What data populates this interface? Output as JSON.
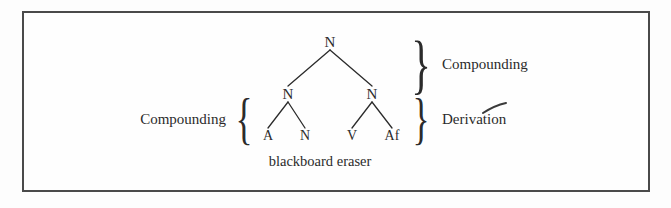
{
  "figure": {
    "background_color": "#fdfdfd",
    "frame_color": "#4a4a4a",
    "ink_color": "#2b2b2b"
  },
  "tree": {
    "root": {
      "label": "N",
      "x": 330,
      "y": 42
    },
    "internal_nodes": [
      {
        "label": "N",
        "x": 288,
        "y": 94
      },
      {
        "label": "N",
        "x": 372,
        "y": 94
      }
    ],
    "terminals": [
      {
        "label": "A",
        "x": 268,
        "y": 136
      },
      {
        "label": "N",
        "x": 305,
        "y": 136
      },
      {
        "label": "V",
        "x": 352,
        "y": 136
      },
      {
        "label": "Af",
        "x": 392,
        "y": 136
      }
    ],
    "edges": [
      {
        "x1": 330,
        "y1": 50,
        "x2": 288,
        "y2": 86
      },
      {
        "x1": 330,
        "y1": 50,
        "x2": 372,
        "y2": 86
      },
      {
        "x1": 288,
        "y1": 102,
        "x2": 268,
        "y2": 128
      },
      {
        "x1": 288,
        "y1": 102,
        "x2": 305,
        "y2": 128
      },
      {
        "x1": 372,
        "y1": 102,
        "x2": 352,
        "y2": 128
      },
      {
        "x1": 372,
        "y1": 102,
        "x2": 392,
        "y2": 128
      }
    ]
  },
  "word": {
    "text": "blackboard eraser",
    "x": 320,
    "y": 161
  },
  "annotations": [
    {
      "id": "compounding-right",
      "label": "Compounding",
      "brace": "}",
      "brace_x": 421,
      "brace_y": 64,
      "brace_height": 62,
      "label_x": 442,
      "label_y": 64
    },
    {
      "id": "compounding-left",
      "label": "Compounding",
      "brace": "{",
      "brace_x": 244,
      "brace_y": 119,
      "brace_height": 54,
      "label_x": 226,
      "label_y": 119
    },
    {
      "id": "derivation-right",
      "label": "Derivation",
      "brace": "}",
      "brace_x": 421,
      "brace_y": 119,
      "brace_height": 54,
      "label_x": 442,
      "label_y": 119
    }
  ],
  "pen_mark": {
    "name": "handwritten-slash-mark",
    "x1": 483,
    "y1": 113,
    "x2": 506,
    "y2": 103
  }
}
